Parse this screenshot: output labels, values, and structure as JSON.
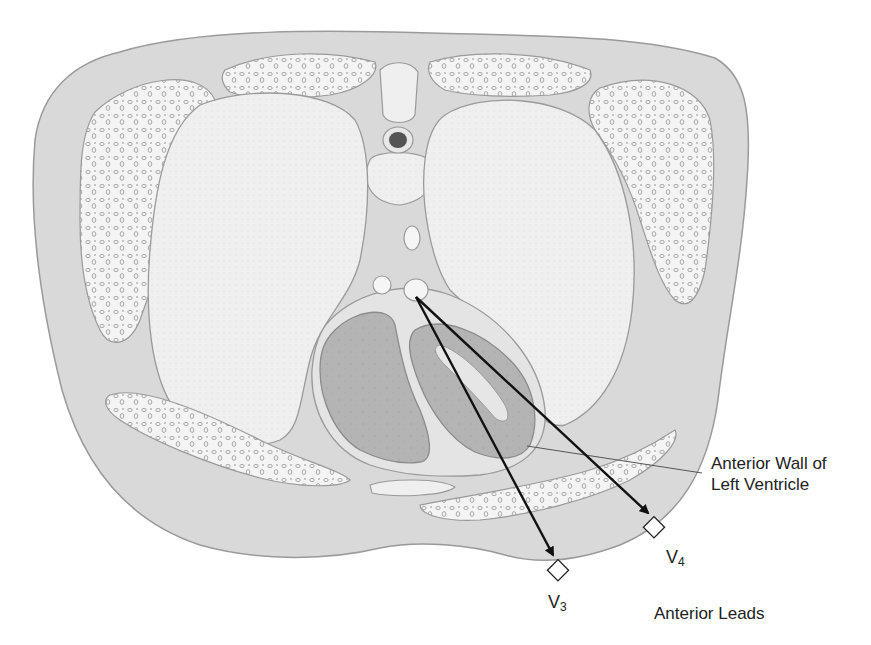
{
  "figure": {
    "colors": {
      "background": "#ffffff",
      "soft_tissue": "#d9d9d9",
      "outline": "#9a9a9a",
      "lung": "#efefef",
      "bone": "#f4f4f4",
      "bone_pore": "#c8c8c8",
      "pericardium": "#e4e4e4",
      "heart_muscle": "#b4b4b4",
      "heart_cavity": "#e6e6e6",
      "vertebra_canal": "#555555",
      "arrow": "#111111",
      "leader_line": "#555555",
      "text": "#222222"
    }
  },
  "labels": {
    "anterior_wall_line1": "Anterior Wall of",
    "anterior_wall_line2": "Left Ventricle",
    "group_label": "Anterior Leads"
  },
  "leads": [
    {
      "id": "V3",
      "letter": "V",
      "number": "3",
      "electrode_x": 558,
      "electrode_y": 571,
      "label_x": 548,
      "label_y": 590
    },
    {
      "id": "V4",
      "letter": "V",
      "number": "4",
      "electrode_x": 654,
      "electrode_y": 528,
      "label_x": 666,
      "label_y": 545
    }
  ],
  "arrows": {
    "origin": {
      "x": 416,
      "y": 297
    },
    "targets": [
      {
        "lead": "V3",
        "x": 553,
        "y": 555
      },
      {
        "lead": "V4",
        "x": 648,
        "y": 513
      }
    ]
  },
  "leader_line": {
    "x1": 527,
    "y1": 446,
    "x2": 702,
    "y2": 473
  }
}
